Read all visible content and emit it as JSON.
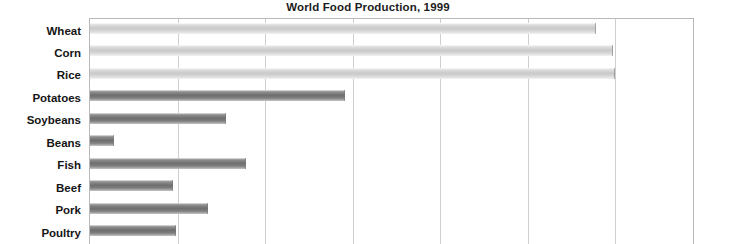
{
  "chart_data": {
    "type": "bar",
    "orientation": "horizontal",
    "title": "World Food Production, 1999",
    "xlabel": "",
    "ylabel": "",
    "categories": [
      "Wheat",
      "Corn",
      "Rice",
      "Potatoes",
      "Soybeans",
      "Beans",
      "Fish",
      "Beef",
      "Pork",
      "Poultry"
    ],
    "values": [
      586,
      605,
      608,
      295,
      157,
      28,
      180,
      96,
      137,
      100
    ],
    "xlim": [
      0,
      700
    ],
    "xticks": [
      0,
      100,
      200,
      300,
      400,
      500,
      600,
      700
    ],
    "grid": true,
    "legend": false,
    "series": [
      {
        "name": "World Food Production 1999",
        "values": [
          586,
          605,
          608,
          295,
          157,
          28,
          180,
          96,
          137,
          100
        ]
      }
    ],
    "bar_shades": [
      "light",
      "light",
      "light",
      "dark",
      "dark",
      "dark",
      "dark",
      "dark",
      "dark",
      "dark"
    ]
  },
  "colors": {
    "title_text": "#1c1c1c",
    "label_text": "#151515",
    "gridline": "#cfcfcf",
    "frame": "#b9b9b9",
    "bar_light": "#c9c9c9",
    "bar_dark": "#6e6e6e",
    "background": "#ffffff"
  }
}
